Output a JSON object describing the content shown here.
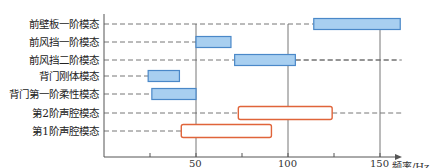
{
  "chart_data": {
    "type": "range-bar",
    "title": "",
    "xlabel": "频率/Hz",
    "ylabel": "",
    "xlim": [
      0,
      170
    ],
    "x_ticks": [
      25,
      50,
      75,
      100,
      125,
      150
    ],
    "x_tick_labels": [
      "",
      "50",
      "",
      "100",
      "",
      "150"
    ],
    "grid": {
      "vertical_lines_at": [
        50,
        100,
        150
      ],
      "dashed_leaders": true
    },
    "categories": [
      "前壁板一阶模态",
      "前风挡一阶模态",
      "前风挡二阶模态",
      "背门刚体模态",
      "背门第一阶柔性模态",
      "第2阶声腔模态",
      "第1阶声腔模态"
    ],
    "series": [
      {
        "name": "结构模态",
        "style": "filled",
        "color": "#a8cff0",
        "edge": "#4a88c8",
        "ranges": [
          [
            114,
            161
          ],
          [
            50,
            69
          ],
          [
            71,
            104
          ],
          [
            24,
            41
          ],
          [
            26,
            50
          ],
          null,
          null
        ]
      },
      {
        "name": "声腔模态",
        "style": "outline",
        "color": "#ffffff",
        "edge": "#e0643a",
        "ranges": [
          null,
          null,
          null,
          null,
          null,
          [
            73,
            124
          ],
          [
            42,
            91
          ]
        ]
      }
    ]
  },
  "axis": {
    "x_title": "频率/Hz",
    "tick_50": "50",
    "tick_100": "100",
    "tick_150": "150"
  },
  "labels": [
    "前壁板一阶模态",
    "前风挡一阶模态",
    "前风挡二阶模态",
    "背门刚体模态",
    "背门第一阶柔性模态",
    "第2阶声腔模态",
    "第1阶声腔模态"
  ]
}
